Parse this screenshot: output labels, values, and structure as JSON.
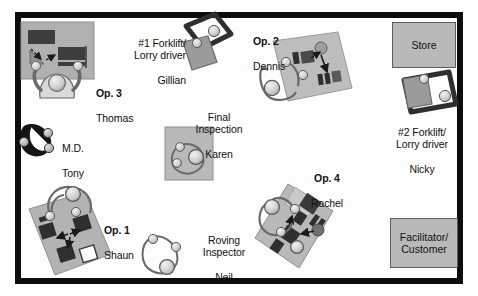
{
  "diagram": {
    "colors": {
      "wall": "#0d0d0d",
      "floor": "#fdfdfd",
      "bench_grey": "#b0b0b0",
      "bench_grey_light": "#c4c4c4",
      "machine_dark": "#3d3d3d",
      "person_body": "#d9d9d9",
      "person_outline": "#5a5a5a",
      "md_dark": "#141414",
      "box_fill": "#b9b9b9",
      "box_border": "#5e5e5e"
    },
    "rooms": [
      {
        "name": "store",
        "label": "Store",
        "x": 392,
        "y": 22,
        "w": 64,
        "h": 46
      },
      {
        "name": "facilitator",
        "label": "Facilitator/\nCustomer",
        "x": 390,
        "y": 218,
        "w": 68,
        "h": 50
      }
    ],
    "stations": [
      {
        "name": "op-3",
        "role": "Op. 3",
        "person": "Thomas",
        "label_x": 96,
        "label_y": 74
      },
      {
        "name": "forklift-1",
        "role": "#1 Forklift/\nLorry driver",
        "person": "Gillian",
        "label_x": 106,
        "label_y": 25
      },
      {
        "name": "op-2",
        "role": "Op. 2",
        "person": "Dennis",
        "label_x": 253,
        "label_y": 22
      },
      {
        "name": "forklift-2",
        "role": "#2 Forklift/\nLorry driver",
        "person": "Nicky",
        "label_x": 382,
        "label_y": 115
      },
      {
        "name": "final-inspection",
        "role": "Final\nInspection",
        "person": "Karen",
        "label_x": 186,
        "label_y": 99
      },
      {
        "name": "md",
        "role": "M.D.",
        "person": "Tony",
        "label_x": 62,
        "label_y": 129
      },
      {
        "name": "op-1",
        "role": "Op. 1",
        "person": "Shaun",
        "label_x": 104,
        "label_y": 211
      },
      {
        "name": "op-4",
        "role": "Op. 4",
        "person": "Rachel",
        "label_x": 303,
        "label_y": 160
      },
      {
        "name": "roving-inspector",
        "role": "Roving\nInspector",
        "person": "Neil",
        "label_x": 195,
        "label_y": 222
      }
    ]
  }
}
